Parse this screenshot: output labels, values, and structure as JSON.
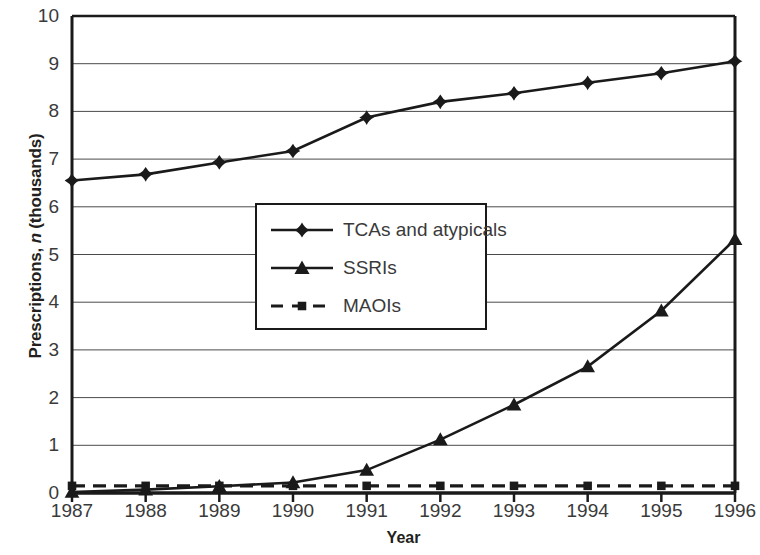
{
  "chart_data": {
    "type": "line",
    "title": "",
    "xlabel": "Year",
    "ylabel_parts": {
      "pre": "Prescriptions, ",
      "italic": "n",
      "post": " (thousands)"
    },
    "ylabel": "Prescriptions, n (thousands)",
    "categories": [
      "1987",
      "1988",
      "1989",
      "1990",
      "1991",
      "1992",
      "1993",
      "1994",
      "1995",
      "1996"
    ],
    "x": [
      1987,
      1988,
      1989,
      1990,
      1991,
      1992,
      1993,
      1994,
      1995,
      1996
    ],
    "xlim": [
      1987,
      1996
    ],
    "ylim": [
      0,
      10
    ],
    "yticks": [
      0,
      1,
      2,
      3,
      4,
      5,
      6,
      7,
      8,
      9,
      10
    ],
    "ytick_labels": [
      "0",
      "1",
      "2",
      "3",
      "4",
      "5",
      "6",
      "7",
      "8",
      "9",
      "10"
    ],
    "grid": "horizontal",
    "legend_position": "center-left inside plot",
    "series": [
      {
        "name": "TCAs and atypicals",
        "marker": "diamond",
        "line_style": "solid",
        "color": "#1a1a1a",
        "values": [
          6.55,
          6.68,
          6.93,
          7.17,
          7.87,
          8.2,
          8.38,
          8.6,
          8.8,
          9.05
        ]
      },
      {
        "name": "SSRIs",
        "marker": "triangle",
        "line_style": "solid",
        "color": "#1a1a1a",
        "values": [
          0.02,
          0.07,
          0.14,
          0.22,
          0.48,
          1.12,
          1.85,
          2.65,
          3.82,
          5.32
        ]
      },
      {
        "name": "MAOIs",
        "marker": "square",
        "line_style": "dashed",
        "color": "#1a1a1a",
        "values": [
          0.15,
          0.15,
          0.15,
          0.15,
          0.15,
          0.15,
          0.15,
          0.15,
          0.15,
          0.15
        ]
      }
    ]
  },
  "legend": {
    "items": [
      {
        "label": "TCAs and atypicals",
        "marker": "diamond-icon",
        "dashed": false
      },
      {
        "label": "SSRIs",
        "marker": "triangle-icon",
        "dashed": false
      },
      {
        "label": "MAOIs",
        "marker": "square-icon",
        "dashed": true
      }
    ]
  }
}
